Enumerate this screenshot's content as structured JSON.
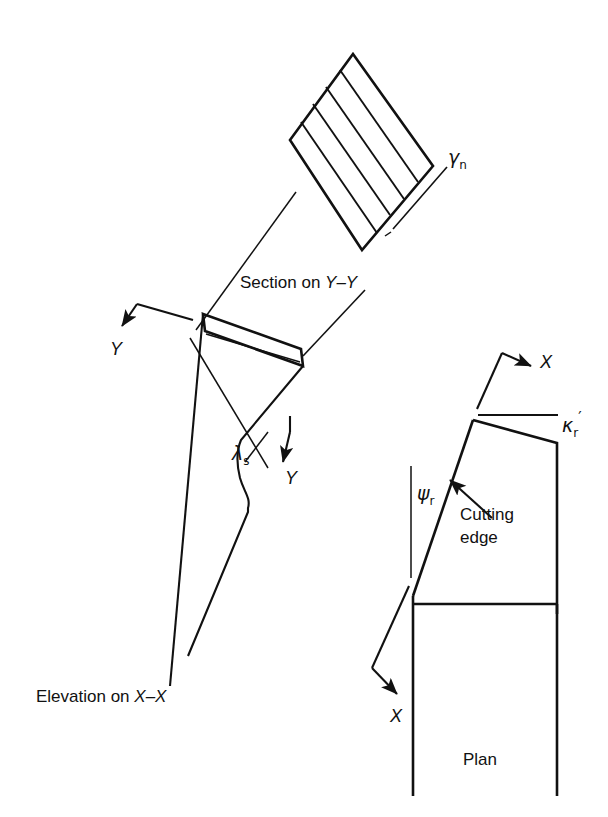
{
  "figure": {
    "ink_color": "#111111",
    "background_color": "#ffffff",
    "width": 608,
    "height": 817
  },
  "labels": {
    "gamma_n": "γ",
    "gamma_n_sub": "n",
    "lambda_s": "λ",
    "lambda_s_sub": "s",
    "psi_r": "ψ",
    "psi_r_sub": "r",
    "kappa_r": "κ",
    "kappa_r_sub": "r",
    "kappa_r_prime": "′",
    "section_on": "Section on ",
    "section_axis": "Y–Y",
    "elevation_on": "Elevation on ",
    "elevation_axis": "X–X",
    "plan": "Plan",
    "cutting_edge_line1": "Cutting",
    "cutting_edge_line2": "edge",
    "axis_y_upper": "Y",
    "axis_y_lower": "Y",
    "axis_x_upper": "X",
    "axis_x_lower": "X"
  },
  "views": {
    "section": {
      "name": "Section on Y-Y",
      "description": "Rotated hatched rectangle representing the normal rake section",
      "hatch_line_count": 5
    },
    "elevation": {
      "name": "Elevation on X-X",
      "description": "Inclined tool shank with wavy relief profile and rake face"
    },
    "plan": {
      "name": "Plan",
      "description": "Plan outline of tool nose showing cutting edge, approach and side angles"
    }
  },
  "angles": [
    {
      "symbol": "γn",
      "name": "normal rake angle",
      "view": "section"
    },
    {
      "symbol": "λs",
      "name": "inclination angle",
      "view": "elevation"
    },
    {
      "symbol": "ψr",
      "name": "approach angle",
      "view": "plan"
    },
    {
      "symbol": "κr′",
      "name": "minor cutting edge angle",
      "view": "plan"
    }
  ]
}
